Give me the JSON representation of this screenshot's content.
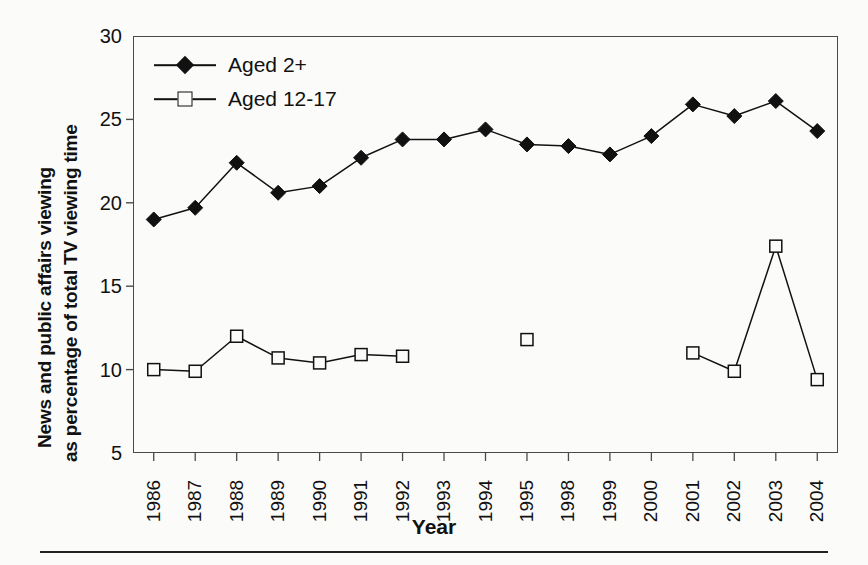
{
  "chart_data": {
    "type": "line",
    "title": "",
    "xlabel": "Year",
    "ylabel": "News and public affairs viewing as percentage of total TV viewing time",
    "ylabel_lines": [
      "News and public affairs viewing",
      "as percentage of total TV viewing time"
    ],
    "categories": [
      "1986",
      "1987",
      "1988",
      "1989",
      "1990",
      "1991",
      "1992",
      "1993",
      "1994",
      "1995",
      "1998",
      "1999",
      "2000",
      "2001",
      "2002",
      "2003",
      "2004"
    ],
    "ylim": [
      5,
      30
    ],
    "yticks": [
      5,
      10,
      15,
      20,
      25,
      30
    ],
    "ytick_labels": [
      "5",
      "10",
      "15",
      "20",
      "25",
      "30"
    ],
    "grid": false,
    "legend_position": "top-left",
    "series": [
      {
        "name": "Aged 2+",
        "marker": "filled-diamond",
        "color": "#111111",
        "values": [
          19.0,
          19.7,
          22.4,
          20.6,
          21.0,
          22.7,
          23.8,
          23.8,
          24.4,
          23.5,
          23.4,
          22.9,
          24.0,
          25.9,
          25.2,
          26.1,
          24.3
        ]
      },
      {
        "name": "Aged 12-17",
        "marker": "open-square",
        "color": "#111111",
        "values": [
          10.0,
          9.9,
          12.0,
          10.7,
          10.4,
          10.9,
          10.8,
          null,
          null,
          11.8,
          null,
          null,
          null,
          11.0,
          9.9,
          17.4,
          9.4
        ]
      }
    ]
  },
  "legend": {
    "items": [
      {
        "label": "Aged 2+",
        "marker": "filled-diamond"
      },
      {
        "label": "Aged 12-17",
        "marker": "open-square"
      }
    ]
  },
  "axes": {
    "x_title": "Year",
    "y_title_line1": "News and public affairs viewing",
    "y_title_line2": "as percentage of total TV viewing time"
  }
}
